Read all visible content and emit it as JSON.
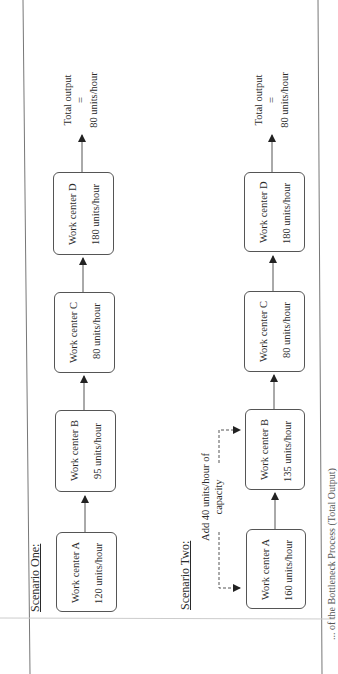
{
  "scenario_one": {
    "heading": "Scenario One:",
    "work_centers": [
      {
        "name": "Work center A",
        "rate": "120 units/hour"
      },
      {
        "name": "Work center B",
        "rate": "95 units/hour"
      },
      {
        "name": "Work center C",
        "rate": "80 units/hour"
      },
      {
        "name": "Work center D",
        "rate": "180  units/hour"
      }
    ],
    "output": {
      "line1": "Total output",
      "line2": "=",
      "line3": "80 units/hour"
    }
  },
  "scenario_two": {
    "heading": "Scenario Two:",
    "annotation": {
      "line1": "Add 40 units/hour of",
      "line2": "capacity"
    },
    "work_centers": [
      {
        "name": "Work center A",
        "rate": "160  units/hour"
      },
      {
        "name": "Work center B",
        "rate": "135  units/hour"
      },
      {
        "name": "Work center C",
        "rate": "80 units/hour"
      },
      {
        "name": "Work center D",
        "rate": "180  units/hour"
      }
    ],
    "output": {
      "line1": "Total output",
      "line2": "=",
      "line3": "80 units/hour"
    }
  },
  "caption": "... of the Bottleneck Process (Total Output)",
  "colors": {
    "line": "#555555",
    "frame": "#777777",
    "text": "#2a2a2a"
  }
}
